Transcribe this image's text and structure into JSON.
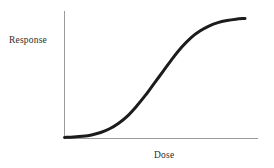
{
  "chart_data": {
    "type": "line",
    "title": "",
    "subtitle": "",
    "xlabel": "Dose",
    "ylabel": "Response",
    "grid": false,
    "legend": null,
    "legend_position": "none",
    "xlim": [
      0,
      1
    ],
    "ylim": [
      0,
      1
    ],
    "xticks": [],
    "yticks": [],
    "xticklabels": [],
    "yticklabels": [],
    "annotations": [],
    "series": [
      {
        "name": "dose-response",
        "shape": "sigmoid",
        "color": "#1c1c1c",
        "linewidth": 3,
        "x": [
          0.0,
          0.05,
          0.1,
          0.15,
          0.2,
          0.25,
          0.3,
          0.35,
          0.4,
          0.45,
          0.5,
          0.55,
          0.6,
          0.65,
          0.7,
          0.75,
          0.8,
          0.85,
          0.9,
          0.95,
          1.0
        ],
        "values": [
          0.005,
          0.008,
          0.014,
          0.025,
          0.045,
          0.075,
          0.12,
          0.18,
          0.26,
          0.35,
          0.45,
          0.55,
          0.65,
          0.74,
          0.815,
          0.87,
          0.91,
          0.938,
          0.955,
          0.966,
          0.972
        ]
      }
    ]
  },
  "axes": {
    "x_axis_color": "#9a9a9a",
    "y_axis_color": "#9a9a9a",
    "axis_linewidth": 1,
    "curve_color": "#1c1c1c",
    "background": "#ffffff"
  },
  "labels": {
    "y_axis_label": "Response",
    "x_axis_label": "Dose"
  }
}
